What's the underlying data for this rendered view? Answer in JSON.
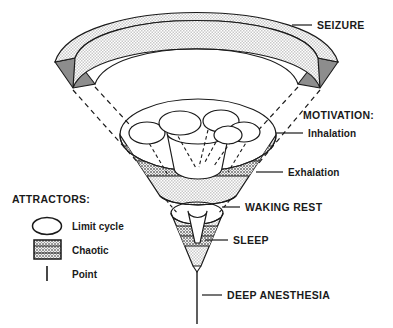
{
  "diagram": {
    "title_absent": true,
    "type": "conceptual-funnel-diagram",
    "labels": {
      "seizure": "SEIZURE",
      "motivation_heading": "MOTIVATION:",
      "inhalation": "Inhalation",
      "exhalation": "Exhalation",
      "waking_rest": "WAKING REST",
      "sleep": "SLEEP",
      "deep_anesthesia": "DEEP ANESTHESIA"
    },
    "legend": {
      "heading": "ATTRACTORS:",
      "items": [
        {
          "label": "Limit cycle",
          "swatch": "ellipse-outline-icon"
        },
        {
          "label": "Chaotic",
          "swatch": "stippled-square-icon"
        },
        {
          "label": "Point",
          "swatch": "vertical-bar-icon"
        }
      ]
    },
    "colors": {
      "ink": "#1a1a1a",
      "stipple_light": "#dcdcdc",
      "stipple_dark": "#a8a8a8",
      "cap_gray": "#8a8a8a",
      "white": "#ffffff"
    },
    "regions": [
      {
        "name": "seizure-arc",
        "attractor": "chaotic",
        "shading": "stipple_light"
      },
      {
        "name": "motivation-funnel",
        "attractor": "limit-cycle-and-chaotic",
        "shading": "stipple_light_and_dark"
      },
      {
        "name": "waking-rest-funnel",
        "attractor": "limit-cycle-and-chaotic",
        "shading": "stipple_light_and_dark"
      },
      {
        "name": "deep-anesthesia-point",
        "attractor": "point",
        "shading": "none"
      }
    ]
  }
}
